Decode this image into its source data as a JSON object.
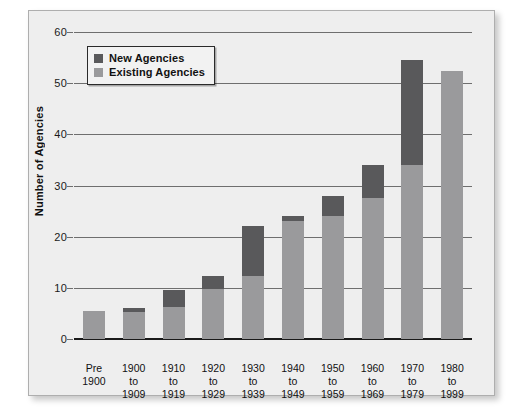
{
  "chart_data": {
    "type": "bar",
    "stacked": true,
    "title": "",
    "xlabel": "",
    "ylabel": "Number of Agencies",
    "ylim": [
      0,
      60
    ],
    "yticks": [
      0,
      10,
      20,
      30,
      40,
      50,
      60
    ],
    "grid": true,
    "legend_position": "top-left",
    "categories": [
      "Pre\n1900",
      "1900\nto\n1909",
      "1910\nto\n1919",
      "1920\nto\n1929",
      "1930\nto\n1939",
      "1940\nto\n1949",
      "1950\nto\n1959",
      "1960\nto\n1969",
      "1970\nto\n1979",
      "1980\nto\n1999"
    ],
    "series": [
      {
        "name": "Existing Agencies",
        "color": "#9a9a9c",
        "values": [
          5.5,
          5.2,
          6.2,
          9.8,
          12.3,
          23.0,
          24.0,
          27.5,
          34.0,
          52.3
        ]
      },
      {
        "name": "New Agencies",
        "color": "#59595b",
        "values": [
          0,
          0.9,
          3.3,
          2.5,
          9.7,
          1.0,
          4.0,
          6.5,
          20.5,
          0
        ]
      }
    ],
    "totals": [
      5.5,
      6.1,
      9.5,
      12.3,
      22.0,
      24.0,
      28.0,
      34.0,
      54.5,
      52.3
    ]
  },
  "legend": {
    "items": [
      {
        "label": "New Agencies",
        "swatch": "new"
      },
      {
        "label": "Existing Agencies",
        "swatch": "existing"
      }
    ]
  },
  "axis": {
    "y_title": "Number of Agencies",
    "y_tick_labels": [
      "0",
      "10",
      "20",
      "30",
      "40",
      "50",
      "60"
    ],
    "x_tick_labels": [
      [
        "Pre",
        "1900"
      ],
      [
        "1900",
        "to",
        "1909"
      ],
      [
        "1910",
        "to",
        "1919"
      ],
      [
        "1920",
        "to",
        "1929"
      ],
      [
        "1930",
        "to",
        "1939"
      ],
      [
        "1940",
        "to",
        "1949"
      ],
      [
        "1950",
        "to",
        "1959"
      ],
      [
        "1960",
        "to",
        "1969"
      ],
      [
        "1970",
        "to",
        "1979"
      ],
      [
        "1980",
        "to",
        "1999"
      ]
    ]
  },
  "colors": {
    "new_agencies": "#59595b",
    "existing_agencies": "#9a9a9c",
    "panel_background": "#eeeeee",
    "gridline": "#6e6e6e",
    "axis": "#1a1a1a"
  }
}
